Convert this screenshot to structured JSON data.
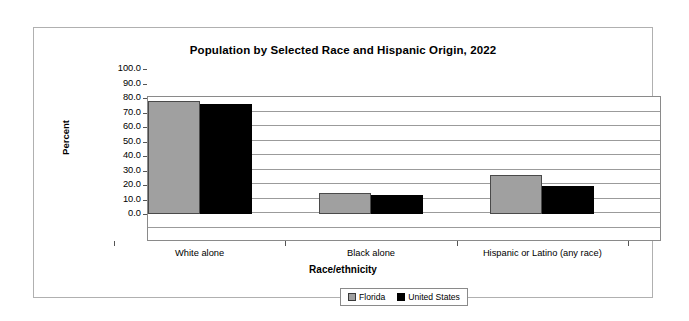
{
  "chart_data": {
    "type": "bar",
    "title": "Population by Selected Race and Hispanic Origin, 2022",
    "xlabel": "Race/ethnicity",
    "ylabel": "Percent",
    "categories": [
      "White alone",
      "Black alone",
      "Hispanic or Latino (any race)"
    ],
    "series": [
      {
        "name": "Florida",
        "color": "#a0a0a0",
        "values": [
          77.6,
          14.5,
          27.1
        ]
      },
      {
        "name": "United States",
        "color": "#000000",
        "values": [
          75.8,
          13.2,
          19.1
        ]
      }
    ],
    "ylim": [
      0,
      100
    ],
    "ytick_labels": [
      "100.0",
      "90.0",
      "80.0",
      "70.0",
      "60.0",
      "50.0",
      "40.0",
      "30.0",
      "20.0",
      "10.0",
      "0.0"
    ],
    "ytick_values": [
      100,
      90,
      80,
      70,
      60,
      50,
      40,
      30,
      20,
      10,
      0
    ],
    "grid": true,
    "legend_position": "bottom"
  },
  "legend": {
    "items": [
      {
        "label": "Florida",
        "swatch": "gray-swatch"
      },
      {
        "label": "United States",
        "swatch": "black-swatch"
      }
    ]
  }
}
